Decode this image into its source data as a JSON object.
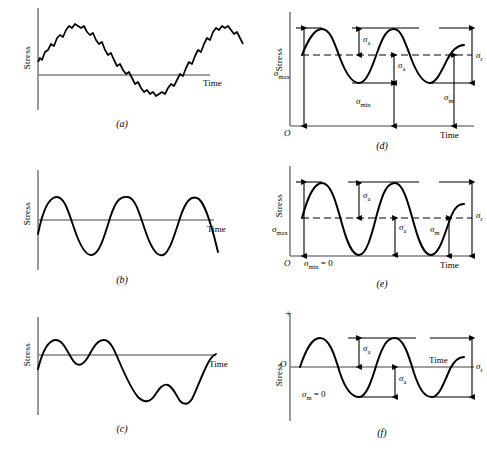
{
  "figure": {
    "axis": {
      "stress_label": "Stress",
      "time_label": "Time",
      "origin_label": "O",
      "plus_label": "+"
    },
    "symbols": {
      "sigma": "σ",
      "sigma_max": "σmax",
      "sigma_min": "σmin",
      "sigma_a": "σa",
      "sigma_m": "σm",
      "sigma_r": "σr",
      "sub_max": "max",
      "sub_min": "min",
      "sub_a": "a",
      "sub_m": "m",
      "sub_r": "r"
    },
    "annotations": {
      "sigma_min_zero": "= 0",
      "sigma_m_zero": "= 0"
    },
    "colors": {
      "curve": "#000000",
      "axis": "#808080",
      "dimension_line": "#000000",
      "background": "#ffffff"
    },
    "panels": [
      {
        "id": "a",
        "caption": "(a)",
        "description": "Irregular noisy sinusoidal stress cycle about a nonzero mean",
        "stress_label": "Stress",
        "time_label": "Time",
        "has_annotations": false
      },
      {
        "id": "b",
        "caption": "(b)",
        "description": "Smooth sinusoidal fluctuating stress cycle",
        "stress_label": "Stress",
        "time_label": "Time",
        "has_annotations": false
      },
      {
        "id": "c",
        "caption": "(c)",
        "description": "Random variable amplitude stress history",
        "stress_label": "Stress",
        "time_label": "Time",
        "has_annotations": false
      },
      {
        "id": "d",
        "caption": "(d)",
        "description": "Fluctuating stress cycle with nonzero mean stress",
        "stress_label": "Stress",
        "time_label": "Time",
        "origin_label": "O",
        "has_annotations": true,
        "labels": [
          "σa",
          "σa",
          "σmax",
          "σmin",
          "σm",
          "σr"
        ]
      },
      {
        "id": "e",
        "caption": "(e)",
        "description": "Repeated stress cycle with minimum stress equal to zero",
        "stress_label": "Stress",
        "time_label": "Time",
        "origin_label": "O",
        "has_annotations": true,
        "labels": [
          "σa",
          "σa",
          "σmax",
          "σm",
          "σr"
        ],
        "note_symbol": "σmin",
        "note_value": "= 0"
      },
      {
        "id": "f",
        "caption": "(f)",
        "description": "Completely reversed stress cycle with mean stress equal to zero",
        "stress_label": "Stress",
        "time_label": "Time",
        "origin_label": "O",
        "plus_label": "+",
        "has_annotations": true,
        "labels": [
          "σa",
          "σa",
          "σr"
        ],
        "note_symbol": "σm",
        "note_value": "= 0"
      }
    ]
  }
}
